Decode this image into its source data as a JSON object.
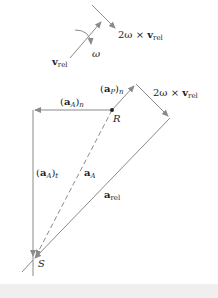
{
  "top_diagram": {
    "v_rel": {
      "bold": "v",
      "sub": "rel"
    },
    "omega": "ω",
    "coriolis": {
      "prefix": "2ω × ",
      "bold": "v",
      "sub": "rel"
    }
  },
  "polygon": {
    "aA_n": {
      "open": "(",
      "bold": "a",
      "sub1": "A",
      "close": ")",
      "sub2": "n"
    },
    "aP_n": {
      "open": "(",
      "bold": "a",
      "sub1": "P",
      "close": ")",
      "sub2": "n"
    },
    "coriolis": {
      "prefix": "2ω × ",
      "bold": "v",
      "sub": "rel"
    },
    "point_R": "R",
    "aA_t": {
      "open": "(",
      "bold": "a",
      "sub1": "A",
      "close": ")",
      "sub2": "t"
    },
    "aA": {
      "bold": "a",
      "sub": "A"
    },
    "a_rel": {
      "bold": "a",
      "sub": "rel"
    },
    "point_S": "S"
  },
  "colors": {
    "line": "#8a8a8a",
    "text": "#222222",
    "strip": "#efefef"
  }
}
